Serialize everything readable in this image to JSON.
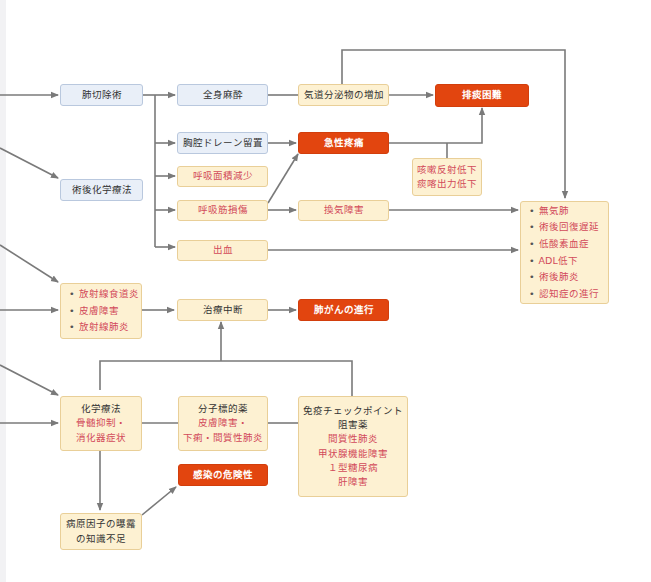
{
  "colors": {
    "blue_fill": "#e9eff8",
    "cream_fill": "#fdf1d2",
    "orange_fill": "#e2450f",
    "red_text": "#d24a5a",
    "line": "#7a7a7a"
  },
  "nodes": {
    "lobectomy": "肺切除術",
    "post_chemo": "術後化学療法",
    "general_anesthesia": "全身麻酔",
    "chest_drain": "胸腔ドレーン留置",
    "resp_area": "呼吸面積減少",
    "resp_muscle": "呼吸筋損傷",
    "bleeding": "出血",
    "secretion": "気道分泌物の増加",
    "sputum": "排痰困難",
    "acute_pain": "急性疼痛",
    "cough": [
      "咳嗽反射低下",
      "痰喀出力低下"
    ],
    "ventilation": "換気障害",
    "complications": [
      "無気肺",
      "術後回復遅延",
      "低酸素血症",
      "ADL低下",
      "術後肺炎",
      "認知症の進行"
    ],
    "radiation": [
      "放射線食道炎",
      "皮膚障害",
      "放射線肺炎"
    ],
    "interruption": "治療中断",
    "progression": "肺がんの進行",
    "chemo": {
      "title": "化学療法",
      "effects": [
        "骨髄抑制・",
        "消化器症状"
      ]
    },
    "targeted": {
      "title": "分子標的薬",
      "effects": [
        "皮膚障害・",
        "下痢・間質性肺炎"
      ]
    },
    "ici": {
      "title": [
        "免疫チェックポイント",
        "阻害薬"
      ],
      "effects": [
        "間質性肺炎",
        "甲状腺機能障害",
        "１型糖尿病",
        "肝障害"
      ]
    },
    "infection": "感染の危険性",
    "knowledge": [
      "病原因子の曝露",
      "の知識不足"
    ]
  }
}
